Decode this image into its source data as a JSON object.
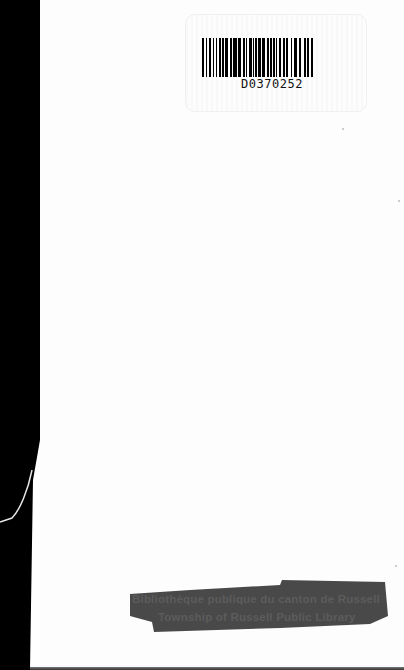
{
  "document": {
    "type": "scanned book cover / endpaper",
    "barcode": {
      "number": "D0370252",
      "bars": [
        3,
        2,
        1,
        3,
        3,
        3,
        1,
        2,
        1,
        3,
        3,
        2,
        2,
        2,
        4,
        2,
        3,
        1,
        5,
        2,
        4,
        2,
        3,
        1,
        2,
        3,
        3,
        2,
        1,
        2,
        2,
        2,
        3,
        2,
        4,
        2,
        3,
        2,
        2,
        2,
        2,
        2,
        1,
        2,
        3,
        3,
        2,
        2,
        3,
        3,
        2,
        3,
        3,
        3,
        3,
        4,
        2,
        2,
        2,
        3,
        3,
        1
      ]
    },
    "stamp": {
      "line1": "Bibliothèque publique du canton de Russell",
      "line2": "Township of Russell Public Library",
      "state": "blacked out with marker"
    },
    "colors": {
      "page": "#fdfdfd",
      "left_band": "#000000",
      "stamp_ink": "#3a3a3a"
    }
  }
}
